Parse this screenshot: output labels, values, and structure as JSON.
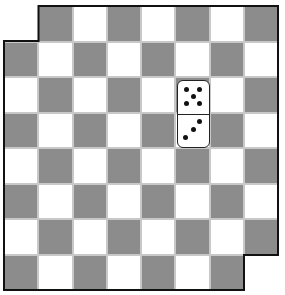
{
  "game": {
    "type": "mutilated-checkerboard-domino",
    "rows": 8,
    "cols": 8,
    "missing_squares": [
      [
        0,
        0
      ],
      [
        7,
        7
      ]
    ],
    "colors": {
      "dark": "#8c8c8c",
      "light": "#ffffff",
      "outline": "#111111"
    },
    "domino": {
      "col": 5,
      "row_top": 2,
      "row_bottom": 3,
      "top_pips": 5,
      "bottom_pips": 3
    }
  }
}
